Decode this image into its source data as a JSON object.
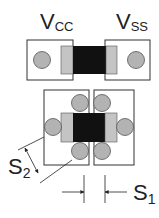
{
  "labels": {
    "vcc_main": "V",
    "vcc_sub": "CC",
    "vss_main": "V",
    "vss_sub": "SS",
    "s1_main": "S",
    "s1_sub": "1",
    "s2_main": "S",
    "s2_sub": "2"
  },
  "colors": {
    "outline": "#333333",
    "pad_fill": "#ffffff",
    "via_fill": "#b3b3b3",
    "terminal_fill": "#c4c4c4",
    "body_fill": "#111111",
    "line": "#222222"
  }
}
